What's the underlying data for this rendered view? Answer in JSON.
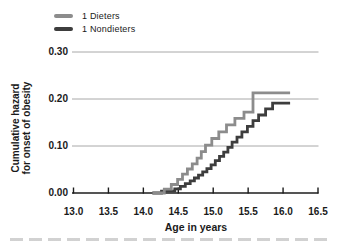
{
  "figure": {
    "background": "#ffffff"
  },
  "legend": {
    "position": "top-left",
    "items": [
      {
        "label": "1 Dieters",
        "color": "#8c8c8c"
      },
      {
        "label": "1 Nondieters",
        "color": "#3d3d3d"
      }
    ]
  },
  "chart_data": {
    "type": "line",
    "subtype": "step-function-cumulative-hazard",
    "title": "",
    "xlabel": "Age in years",
    "ylabel_line1": "Cumulative hazard",
    "ylabel_line2": "for onset of obesity",
    "xlim": [
      13.0,
      16.5
    ],
    "ylim": [
      0,
      0.3
    ],
    "x_tick_labels": [
      "13.0",
      "13.5",
      "14.0",
      "14.5",
      "15.0",
      "15.5",
      "16.0",
      "16.5"
    ],
    "y_tick_labels": [
      "0.00",
      "0.10",
      "0.20",
      "0.30"
    ],
    "grid": "horizontal",
    "grid_color": "#a8a8a8",
    "axis_color": "#1c1c1c",
    "legend_position": "top-left",
    "series": [
      {
        "name": "1 Dieters",
        "color": "#8c8c8c",
        "end_x": 16.1,
        "points": [
          [
            14.13,
            0.0
          ],
          [
            14.3,
            0.008
          ],
          [
            14.4,
            0.018
          ],
          [
            14.49,
            0.029
          ],
          [
            14.56,
            0.04
          ],
          [
            14.63,
            0.051
          ],
          [
            14.7,
            0.062
          ],
          [
            14.77,
            0.074
          ],
          [
            14.83,
            0.088
          ],
          [
            14.89,
            0.102
          ],
          [
            14.98,
            0.116
          ],
          [
            15.08,
            0.13
          ],
          [
            15.19,
            0.145
          ],
          [
            15.31,
            0.159
          ],
          [
            15.44,
            0.172
          ],
          [
            15.57,
            0.213
          ]
        ]
      },
      {
        "name": "1 Nondieters",
        "color": "#3d3d3d",
        "end_x": 16.1,
        "points": [
          [
            14.13,
            0.0
          ],
          [
            14.26,
            0.004
          ],
          [
            14.45,
            0.009
          ],
          [
            14.53,
            0.014
          ],
          [
            14.6,
            0.02
          ],
          [
            14.67,
            0.026
          ],
          [
            14.73,
            0.032
          ],
          [
            14.79,
            0.038
          ],
          [
            14.85,
            0.045
          ],
          [
            14.91,
            0.052
          ],
          [
            14.97,
            0.06
          ],
          [
            15.03,
            0.069
          ],
          [
            15.09,
            0.078
          ],
          [
            15.15,
            0.087
          ],
          [
            15.21,
            0.097
          ],
          [
            15.27,
            0.108
          ],
          [
            15.34,
            0.119
          ],
          [
            15.41,
            0.13
          ],
          [
            15.49,
            0.142
          ],
          [
            15.57,
            0.154
          ],
          [
            15.65,
            0.166
          ],
          [
            15.75,
            0.179
          ],
          [
            15.85,
            0.191
          ]
        ]
      }
    ]
  }
}
